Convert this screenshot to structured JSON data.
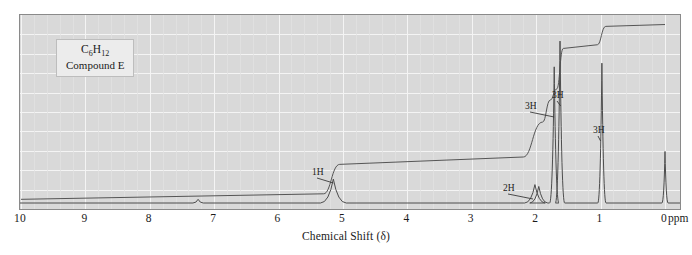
{
  "figure": {
    "type": "nmr-spectrum",
    "sample_label": {
      "formula_text": "C6H12",
      "formula_main": "C",
      "formula_sub1": "6",
      "formula_mid": "H",
      "formula_sub2": "12",
      "compound_name": "Compound E"
    },
    "axis": {
      "title": "Chemical Shift (δ)",
      "unit": "ppm",
      "tick_labels": [
        "10",
        "9",
        "8",
        "7",
        "6",
        "5",
        "4",
        "3",
        "2",
        "1",
        "0"
      ],
      "tick_values": [
        10,
        9,
        8,
        7,
        6,
        5,
        4,
        3,
        2,
        1,
        0
      ],
      "range_min_ppm": 0,
      "range_max_ppm": 10,
      "direction": "right-to-left"
    },
    "colors": {
      "plot_background": "#d9d9d9",
      "gridline": "#f4f4f4",
      "trace": "#4d4d4d",
      "frame": "#8a8a8a",
      "text": "#1a1a1a",
      "label_box_fill": "#ececec"
    },
    "integration_labels": [
      {
        "text": "1H",
        "shift_ppm": 5.15,
        "x": 311,
        "y": 166
      },
      {
        "text": "2H",
        "shift_ppm": 2.05,
        "x": 502,
        "y": 182
      },
      {
        "text": "3H",
        "shift_ppm": 1.72,
        "x": 524,
        "y": 100
      },
      {
        "text": "3H",
        "shift_ppm": 1.62,
        "x": 551,
        "y": 89
      },
      {
        "text": "3H",
        "shift_ppm": 1.0,
        "x": 592,
        "y": 124
      }
    ]
  },
  "chart_data": {
    "type": "line",
    "title": "",
    "subtitle": "",
    "xlabel": "Chemical Shift (δ)",
    "ylabel": "",
    "xlim": [
      10,
      0
    ],
    "ylim": [
      0,
      100
    ],
    "grid": true,
    "legend": null,
    "x_tick_labels": [
      "10",
      "9",
      "8",
      "7",
      "6",
      "5",
      "4",
      "3",
      "2",
      "1",
      "0"
    ],
    "x_unit": "ppm",
    "series": [
      {
        "name": "spectrum",
        "kind": "peaks",
        "peaks": [
          {
            "shift_ppm": 7.25,
            "height_pct": 2.0,
            "width_ppm": 0.02,
            "assignment": "trace impurity"
          },
          {
            "shift_ppm": 5.15,
            "height_pct": 13.0,
            "width_ppm": 0.05,
            "assignment": "1H vinyl"
          },
          {
            "shift_ppm": 2.02,
            "height_pct": 10.0,
            "width_ppm": 0.04,
            "assignment": "2H allylic"
          },
          {
            "shift_ppm": 1.96,
            "height_pct": 9.0,
            "width_ppm": 0.035,
            "assignment": "2H allylic"
          },
          {
            "shift_ppm": 1.72,
            "height_pct": 74.0,
            "width_ppm": 0.018,
            "assignment": "3H methyl"
          },
          {
            "shift_ppm": 1.63,
            "height_pct": 88.0,
            "width_ppm": 0.018,
            "assignment": "3H methyl"
          },
          {
            "shift_ppm": 0.98,
            "height_pct": 76.0,
            "width_ppm": 0.016,
            "assignment": "3H methyl"
          },
          {
            "shift_ppm": 0.0,
            "height_pct": 28.0,
            "width_ppm": 0.012,
            "assignment": "TMS reference"
          }
        ]
      },
      {
        "name": "integration",
        "kind": "step-trace",
        "steps": [
          {
            "shift_ppm": 10.0,
            "level_pct": 2.0
          },
          {
            "shift_ppm": 5.3,
            "level_pct": 5.0
          },
          {
            "shift_ppm": 5.05,
            "level_pct": 21.0
          },
          {
            "shift_ppm": 2.2,
            "level_pct": 25.0
          },
          {
            "shift_ppm": 1.9,
            "level_pct": 44.0
          },
          {
            "shift_ppm": 1.78,
            "level_pct": 56.0
          },
          {
            "shift_ppm": 1.68,
            "level_pct": 62.0
          },
          {
            "shift_ppm": 1.58,
            "level_pct": 84.0
          },
          {
            "shift_ppm": 1.05,
            "level_pct": 86.0
          },
          {
            "shift_ppm": 0.92,
            "level_pct": 96.0
          },
          {
            "shift_ppm": 0.0,
            "level_pct": 97.0
          }
        ]
      }
    ],
    "annotations": [
      {
        "text": "1H",
        "shift_ppm": 5.15
      },
      {
        "text": "2H",
        "shift_ppm": 2.05
      },
      {
        "text": "3H",
        "shift_ppm": 1.72
      },
      {
        "text": "3H",
        "shift_ppm": 1.62
      },
      {
        "text": "3H",
        "shift_ppm": 1.0
      }
    ]
  }
}
